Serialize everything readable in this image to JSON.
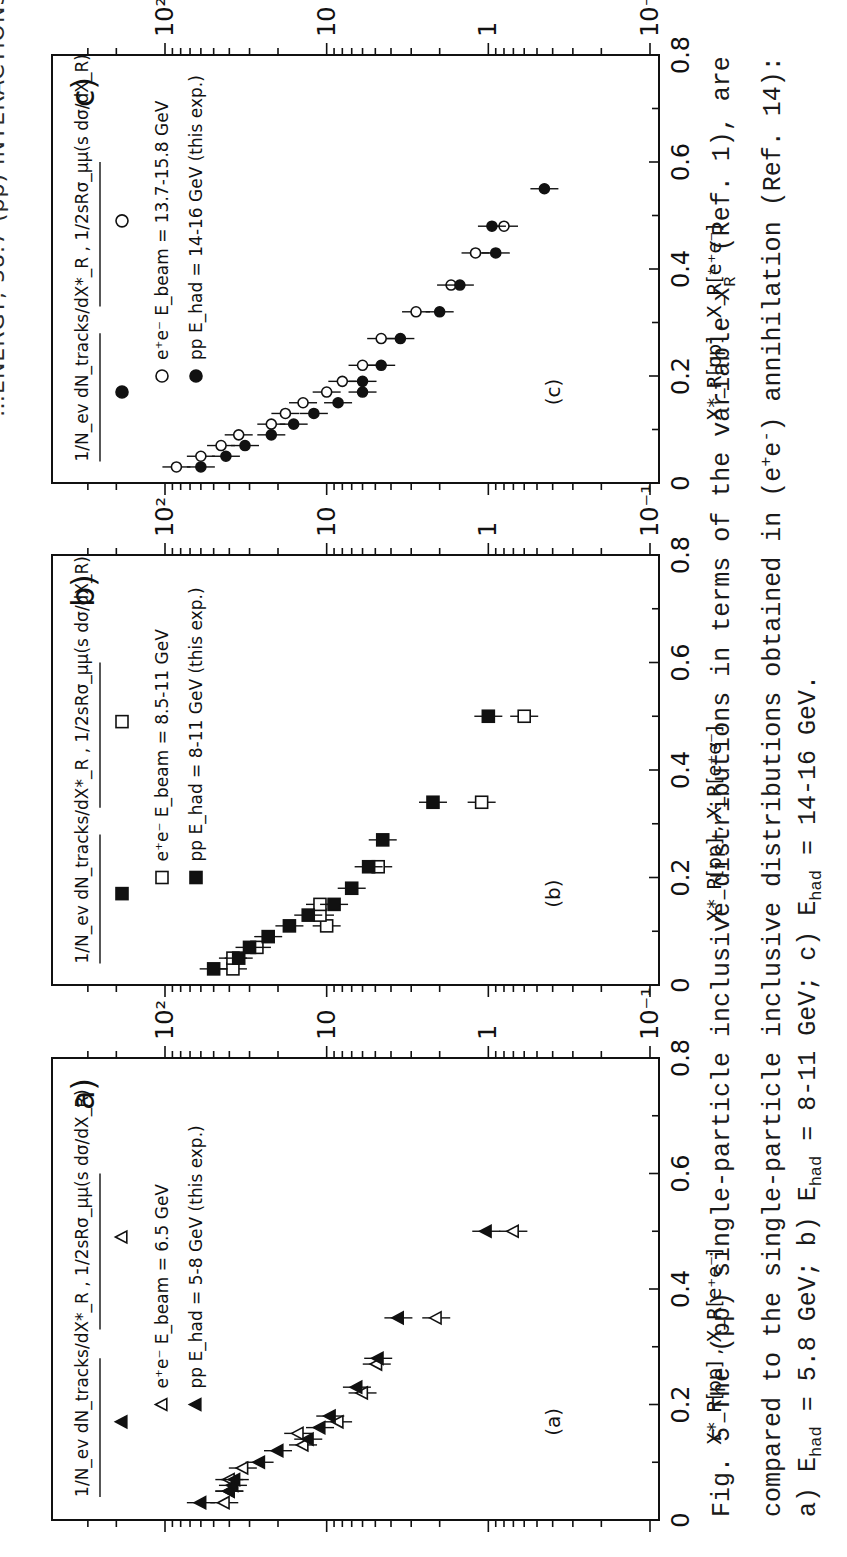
{
  "header": {
    "text": "…ENERGY, 38.7 (pp) INTERACTIONS"
  },
  "figure": {
    "axis_tick_labels_y": [
      "10²",
      "10",
      "1",
      "10⁻¹"
    ],
    "axis_tick_labels_x": [
      "0",
      "0.2",
      "0.4",
      "0.6",
      "0.8"
    ],
    "ylabel_left": "1/N",
    "ylabel_full": "1/N_ev dN_tracks/dX*_R , 1/2sRσ_μμ (s dσ/dX_R)",
    "xlabel_full": "X*_R[pp] , X_R[e⁺e⁻]"
  },
  "caption": {
    "line1": "Fig. 5 The (pp) single-particle inclusive distributions in terms of the variable x",
    "line1_tail": "(Ref. 1), are",
    "line2": "compared to the single-particle inclusive distributions obtained in (e",
    "line2_tail": ") annihilation (Ref. 14):",
    "line3_a": "a) E",
    "line3_b": " = 5.8 GeV; b) E",
    "line3_c": " = 8-11 GeV; c) E",
    "line3_d": " = 14-16 GeV.",
    "sub_had": "had",
    "sub_R": "R",
    "sup_star": "*",
    "sup_plus": "+",
    "sup_minus": "-"
  },
  "chart_data": [
    {
      "panel": "a)",
      "inner_label": "(a)",
      "type": "scatter",
      "title": "a)",
      "xlabel": "X*_R[pp] , X_R[e+e-]",
      "ylabel": "1/N_ev dN_tracks/dX*_R , 1/2sRσ_μμ (s dσ/dX_R)",
      "xlim": [
        0,
        0.8
      ],
      "ylim": [
        0.1,
        100
      ],
      "yscale": "log",
      "legend": [
        {
          "marker": "open-triangle",
          "label": "e⁺e⁻ E_beam = 6.5 GeV"
        },
        {
          "marker": "filled-triangle",
          "label": "pp E_had = 5-8 GeV (this exp.)"
        }
      ],
      "formula_markers": {
        "pp": "filled-triangle",
        "ee": "open-triangle"
      },
      "series": [
        {
          "name": "e+e- E_beam = 6.5 GeV",
          "marker": "open-triangle",
          "x": [
            0.03,
            0.05,
            0.07,
            0.09,
            0.13,
            0.15,
            0.17,
            0.22,
            0.27,
            0.35,
            0.5
          ],
          "y": [
            43,
            40,
            40,
            33,
            14,
            15,
            8.5,
            6,
            4.9,
            2.1,
            0.7
          ]
        },
        {
          "name": "pp E_had = 5-8 GeV (this exp.)",
          "marker": "filled-triangle",
          "x": [
            0.03,
            0.05,
            0.06,
            0.07,
            0.1,
            0.12,
            0.14,
            0.16,
            0.18,
            0.23,
            0.28,
            0.35,
            0.5
          ],
          "y": [
            60,
            40,
            38,
            37,
            26,
            20,
            13,
            11,
            9.5,
            6.5,
            4.8,
            3.6,
            1.03
          ]
        }
      ]
    },
    {
      "panel": "b)",
      "inner_label": "(b)",
      "type": "scatter",
      "title": "b)",
      "xlabel": "X*_R[pp] , X_R[e+e-]",
      "ylabel": "1/N_ev dN_tracks/dX*_R , 1/2sRσ_μμ (s dσ/dX_R)",
      "xlim": [
        0,
        0.8
      ],
      "ylim": [
        0.1,
        100
      ],
      "yscale": "log",
      "legend": [
        {
          "marker": "open-square",
          "label": "e⁺e⁻ E_beam = 8.5-11 GeV"
        },
        {
          "marker": "filled-square",
          "label": "pp E_had = 8-11 GeV (this exp.)"
        }
      ],
      "formula_markers": {
        "pp": "filled-square",
        "ee": "open-square"
      },
      "series": [
        {
          "name": "e+e- E_beam = 8.5-11 GeV",
          "marker": "open-square",
          "x": [
            0.03,
            0.05,
            0.07,
            0.11,
            0.13,
            0.15,
            0.22,
            0.34,
            0.5
          ],
          "y": [
            38,
            38,
            27,
            10,
            11,
            11,
            4.8,
            1.1,
            0.6
          ]
        },
        {
          "name": "pp E_had = 8-11 GeV (this exp.)",
          "marker": "filled-square",
          "x": [
            0.03,
            0.05,
            0.07,
            0.09,
            0.11,
            0.13,
            0.15,
            0.18,
            0.22,
            0.27,
            0.34,
            0.5
          ],
          "y": [
            50,
            35,
            30,
            23,
            17,
            13,
            9,
            7,
            5.5,
            4.5,
            2.2,
            1.0
          ]
        }
      ]
    },
    {
      "panel": "c)",
      "inner_label": "(c)",
      "type": "scatter",
      "title": "c)",
      "xlabel": "X*_R[pp] , X_R[e+e-]",
      "ylabel": "1/N_ev dN_tracks/dX*_R , 1/2sRσ_μμ (s dσ/dX_R)",
      "xlim": [
        0,
        0.8
      ],
      "ylim": [
        0.1,
        100
      ],
      "yscale": "log",
      "legend": [
        {
          "marker": "open-circle",
          "label": "e⁺e⁻ E_beam = 13.7-15.8 GeV"
        },
        {
          "marker": "filled-circle",
          "label": "pp E_had = 14-16 GeV (this exp.)"
        }
      ],
      "formula_markers": {
        "pp": "filled-circle",
        "ee": "open-circle"
      },
      "series": [
        {
          "name": "e+e- E_beam = 13.7-15.8 GeV",
          "marker": "open-circle",
          "x": [
            0.03,
            0.05,
            0.07,
            0.09,
            0.11,
            0.13,
            0.15,
            0.17,
            0.19,
            0.22,
            0.27,
            0.32,
            0.37,
            0.43,
            0.48
          ],
          "y": [
            85,
            60,
            45,
            35,
            22,
            18,
            14,
            10,
            8,
            6,
            4.6,
            2.8,
            1.7,
            1.2,
            0.8
          ]
        },
        {
          "name": "pp E_had = 14-16 GeV (this exp.)",
          "marker": "filled-circle",
          "x": [
            0.03,
            0.05,
            0.07,
            0.09,
            0.11,
            0.13,
            0.15,
            0.17,
            0.19,
            0.22,
            0.27,
            0.32,
            0.37,
            0.43,
            0.48,
            0.55
          ],
          "y": [
            60,
            42,
            32,
            22,
            16,
            12,
            8.5,
            6,
            6,
            4.6,
            3.5,
            2.0,
            1.5,
            0.9,
            0.95,
            0.45
          ]
        }
      ]
    }
  ]
}
